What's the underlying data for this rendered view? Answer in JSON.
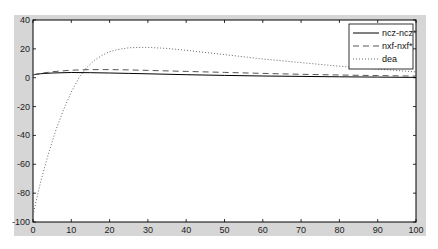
{
  "chart_data": {
    "type": "line",
    "title": "",
    "xlabel": "",
    "ylabel": "",
    "xlim": [
      0,
      100
    ],
    "ylim": [
      -100,
      40
    ],
    "xticks": [
      0,
      10,
      20,
      30,
      40,
      50,
      60,
      70,
      80,
      90,
      100
    ],
    "yticks": [
      40,
      20,
      0,
      -20,
      -40,
      -60,
      -80,
      -100
    ],
    "grid": false,
    "legend_position": "upper right",
    "series": [
      {
        "name": "ncz-ncz*",
        "style": "solid",
        "color": "#000000",
        "x": [
          0,
          2,
          5,
          10,
          15,
          20,
          25,
          30,
          40,
          50,
          60,
          70,
          80,
          90,
          100
        ],
        "y": [
          2.0,
          2.8,
          3.3,
          3.6,
          3.5,
          3.3,
          3.0,
          2.7,
          2.1,
          1.6,
          1.2,
          0.9,
          0.6,
          0.4,
          0.2
        ]
      },
      {
        "name": "nxf-nxf*",
        "style": "dashed",
        "color": "#555555",
        "x": [
          0,
          2,
          5,
          10,
          15,
          20,
          25,
          30,
          40,
          50,
          60,
          70,
          80,
          90,
          100
        ],
        "y": [
          2.0,
          3.0,
          4.2,
          5.2,
          5.6,
          5.6,
          5.4,
          5.1,
          4.4,
          3.7,
          3.0,
          2.4,
          1.9,
          1.5,
          1.1
        ]
      },
      {
        "name": "dea",
        "style": "dotted",
        "color": "#666666",
        "x": [
          0,
          2,
          4,
          6,
          8,
          10,
          12,
          14,
          16,
          18,
          20,
          22,
          25,
          28,
          30,
          35,
          40,
          50,
          60,
          70,
          80,
          90,
          100
        ],
        "y": [
          -95,
          -72,
          -53,
          -36,
          -22,
          -10,
          0,
          7,
          12,
          15.5,
          18,
          19.5,
          20.7,
          21,
          21,
          20.3,
          19,
          16,
          13,
          10.5,
          8,
          6,
          4
        ]
      }
    ]
  },
  "legend": {
    "items": [
      {
        "label": "ncz-ncz*"
      },
      {
        "label": "nxf-nxf*"
      },
      {
        "label": "dea"
      }
    ]
  }
}
